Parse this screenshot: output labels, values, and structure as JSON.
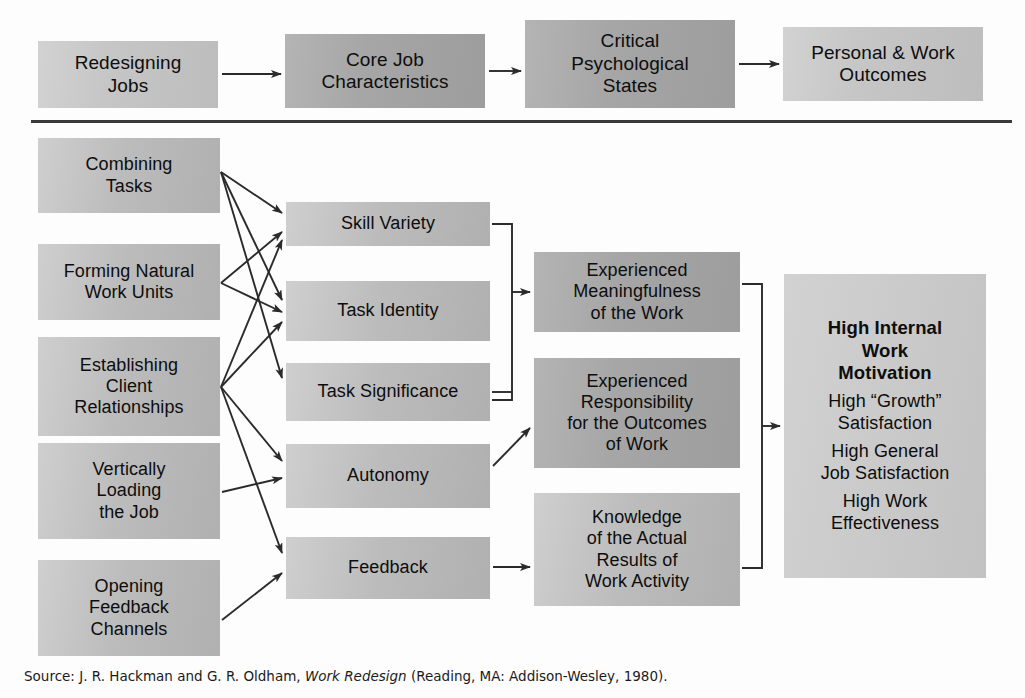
{
  "diagram": {
    "divider_present": true,
    "colors": {
      "box_light": "#c8c8c8",
      "box_dark": "#a8a8a8",
      "line": "#2b2b2b",
      "text": "#0d0d0d",
      "background": "#fdfdfd"
    }
  },
  "header_row": {
    "boxes": [
      {
        "label": "Redesigning\nJobs",
        "shade": "light"
      },
      {
        "label": "Core Job\nCharacteristics",
        "shade": "dark"
      },
      {
        "label": "Critical\nPsychological\nStates",
        "shade": "dark"
      },
      {
        "label": "Personal & Work\nOutcomes",
        "shade": "light"
      }
    ]
  },
  "implementing_concepts": {
    "column_title": "Redesigning Jobs",
    "boxes": [
      {
        "label": "Combining\nTasks"
      },
      {
        "label": "Forming Natural\nWork Units"
      },
      {
        "label": "Establishing\nClient\nRelationships"
      },
      {
        "label": "Vertically\nLoading\nthe Job"
      },
      {
        "label": "Opening\nFeedback\nChannels"
      }
    ]
  },
  "core_job_characteristics": {
    "column_title": "Core Job Characteristics",
    "boxes": [
      {
        "label": "Skill Variety"
      },
      {
        "label": "Task Identity"
      },
      {
        "label": "Task Significance"
      },
      {
        "label": "Autonomy"
      },
      {
        "label": "Feedback"
      }
    ]
  },
  "critical_psychological_states": {
    "column_title": "Critical Psychological States",
    "boxes": [
      {
        "label": "Experienced\nMeaningfulness\nof the Work"
      },
      {
        "label": "Experienced\nResponsibility\nfor the Outcomes\nof Work"
      },
      {
        "label": "Knowledge\nof the Actual\nResults of\nWork Activity"
      }
    ]
  },
  "personal_work_outcomes": {
    "column_title": "Personal & Work Outcomes",
    "lines": [
      {
        "text": "High Internal\nWork\nMotivation",
        "emphasis": "bold"
      },
      {
        "text": "High “Growth”\nSatisfaction",
        "emphasis": "normal"
      },
      {
        "text": "High General\nJob Satisfaction",
        "emphasis": "normal"
      },
      {
        "text": "High Work\nEffectiveness",
        "emphasis": "normal"
      }
    ]
  },
  "source": {
    "prefix": "Source: J. R. Hackman and G. R. Oldham, ",
    "italic_title": "Work Redesign",
    "suffix": " (Reading, MA: Addison-Wesley, 1980)."
  }
}
